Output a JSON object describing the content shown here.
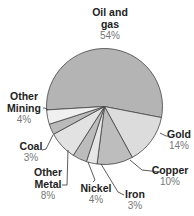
{
  "chart_data": {
    "type": "pie",
    "title": "",
    "start_angle_deg": 176.6,
    "direction": "clockwise",
    "slices": [
      {
        "label": "Oil and gas",
        "label_lines": [
          "Oil and",
          "gas"
        ],
        "value": 54,
        "pct_text": "54%",
        "color": "#b4b4b4"
      },
      {
        "label": "Gold",
        "label_lines": [
          "Gold"
        ],
        "value": 14,
        "pct_text": "14%",
        "color": "#dcdcdc"
      },
      {
        "label": "Copper",
        "label_lines": [
          "Copper"
        ],
        "value": 10,
        "pct_text": "10%",
        "color": "#bdbdbd"
      },
      {
        "label": "Iron",
        "label_lines": [
          "Iron"
        ],
        "value": 3,
        "pct_text": "3%",
        "color": "#e6e6e6"
      },
      {
        "label": "Nickel",
        "label_lines": [
          "Nickel"
        ],
        "value": 4,
        "pct_text": "4%",
        "color": "#bcbcbc"
      },
      {
        "label": "Other Metal",
        "label_lines": [
          "Other",
          "Metal"
        ],
        "value": 8,
        "pct_text": "8%",
        "color": "#e2e2e2"
      },
      {
        "label": "Coal",
        "label_lines": [
          "Coal"
        ],
        "value": 3,
        "pct_text": "3%",
        "color": "#bababa"
      },
      {
        "label": "Other Mining",
        "label_lines": [
          "Other",
          "Mining"
        ],
        "value": 4,
        "pct_text": "4%",
        "color": "#f0f0f0"
      }
    ]
  },
  "labels": {
    "oil": {
      "l1": "Oil and",
      "l2": "gas",
      "pct": "54%"
    },
    "gold": {
      "l1": "Gold",
      "pct": "14%"
    },
    "copper": {
      "l1": "Copper",
      "pct": "10%"
    },
    "iron": {
      "l1": "Iron",
      "pct": "3%"
    },
    "nickel": {
      "l1": "Nickel",
      "pct": "4%"
    },
    "metal": {
      "l1": "Other",
      "l2": "Metal",
      "pct": "8%"
    },
    "coal": {
      "l1": "Coal",
      "pct": "3%"
    },
    "mining": {
      "l1": "Other",
      "l2": "Mining",
      "pct": "4%"
    }
  }
}
